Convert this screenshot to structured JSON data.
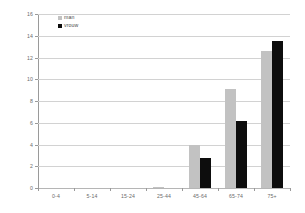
{
  "chart_data": {
    "type": "bar",
    "title": "",
    "subtitle": "",
    "xlabel": "",
    "ylabel": "",
    "categories": [
      "0-4",
      "5-14",
      "15-24",
      "25-44",
      "45-64",
      "65-74",
      "75+"
    ],
    "series": [
      {
        "name": "man",
        "color": "#c2c2c2",
        "values": [
          0,
          0,
          0,
          0.1,
          4.0,
          9.1,
          12.6
        ]
      },
      {
        "name": "vrouw",
        "color": "#0d0d0d",
        "values": [
          0,
          0,
          0,
          0,
          2.8,
          6.2,
          13.5
        ]
      }
    ],
    "ylim": [
      0,
      16
    ],
    "ytick_labels": [
      "16",
      "14",
      "12",
      "10",
      "8",
      "6",
      "4",
      "2",
      "0"
    ],
    "ytick_values": [
      16,
      14,
      12,
      10,
      8,
      6,
      4,
      2,
      0
    ],
    "grid": true,
    "grid_axis": "y",
    "legend_position": "top-left-inside",
    "gridline_color": "#d2d2d2",
    "axis_color": "#9a9a9a",
    "background_color": "#ffffff",
    "text_color": "#6b6b6b"
  },
  "legend": {
    "entries": [
      {
        "label": "man"
      },
      {
        "label": "vrouw"
      }
    ]
  }
}
